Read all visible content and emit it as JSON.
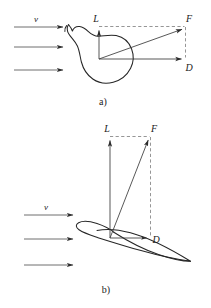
{
  "figure": {
    "background_color": "#ffffff",
    "ink_color": "#262626",
    "dashed_color": "#8a8a8a",
    "width": 211,
    "height": 308,
    "panels": [
      {
        "id": "a",
        "caption": "a)",
        "body_name": "blunt-irregular-body",
        "flow_label": "v",
        "flow_arrow_count": 3,
        "vectors": [
          {
            "name": "lift",
            "label": "L",
            "direction": "up"
          },
          {
            "name": "drag",
            "label": "D",
            "direction": "right"
          },
          {
            "name": "resultant-force",
            "label": "F",
            "direction": "up-right"
          }
        ],
        "origin": {
          "x": 99,
          "y": 59
        },
        "lift_tip": {
          "x": 99,
          "y": 27
        },
        "drag_tip": {
          "x": 186,
          "y": 59
        },
        "force_tip": {
          "x": 186,
          "y": 27
        }
      },
      {
        "id": "b",
        "caption": "b)",
        "body_name": "airfoil",
        "flow_label": "v",
        "flow_arrow_count": 3,
        "vectors": [
          {
            "name": "lift",
            "label": "L",
            "direction": "up"
          },
          {
            "name": "drag",
            "label": "D",
            "direction": "right"
          },
          {
            "name": "resultant-force",
            "label": "F",
            "direction": "up-right"
          }
        ],
        "origin": {
          "x": 110,
          "y": 238
        },
        "lift_tip": {
          "x": 110,
          "y": 137
        },
        "drag_tip": {
          "x": 151,
          "y": 238
        },
        "force_tip": {
          "x": 151,
          "y": 137
        }
      }
    ],
    "labels": {
      "lift": "L",
      "drag": "D",
      "force": "F",
      "velocity": "v",
      "caption_a": "a)",
      "caption_b": "b)"
    }
  }
}
